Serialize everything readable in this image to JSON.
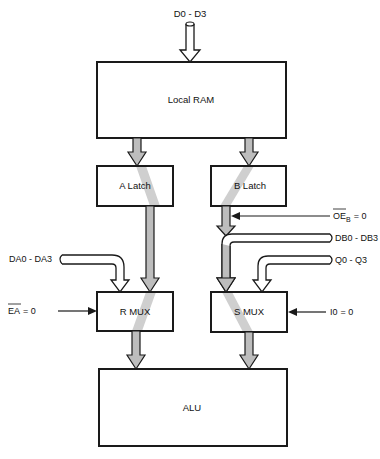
{
  "diagram": {
    "inputs": {
      "top_bus": "D0 - D3",
      "da_bus": "DA0 - DA3",
      "db_bus": "DB0 - DB3",
      "q_bus": "Q0 - Q3"
    },
    "controls": {
      "oeb": {
        "signal": "OE",
        "subscript": "B",
        "value": "= 0"
      },
      "ea": {
        "signal": "EA",
        "value": "= 0"
      },
      "i0": {
        "signal": "I0",
        "value": "= 0"
      }
    },
    "blocks": {
      "local_ram": "Local RAM",
      "a_latch": "A Latch",
      "b_latch": "B Latch",
      "r_mux": "R MUX",
      "s_mux": "S MUX",
      "alu": "ALU"
    },
    "colors": {
      "line": "#1a1a1a",
      "active_path": "#bdbdbd",
      "background": "#ffffff"
    }
  }
}
